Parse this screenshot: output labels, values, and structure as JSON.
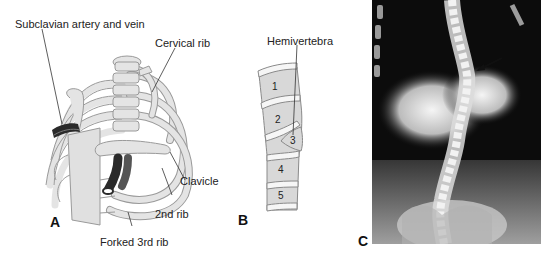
{
  "panels": {
    "a": {
      "letter": "A",
      "labels": {
        "subclavian": "Subclavian artery and vein",
        "cervical_rib": "Cervical rib",
        "clavicle": "Clavicle",
        "second_rib": "2nd rib",
        "forked_third_rib": "Forked 3rd rib"
      }
    },
    "b": {
      "letter": "B",
      "labels": {
        "hemivertebra": "Hemivertebra"
      },
      "vertebrae": [
        "1",
        "2",
        "3",
        "4",
        "5"
      ]
    },
    "c": {
      "letter": "C"
    }
  },
  "colors": {
    "bone": "#e4e4e4",
    "bone_outline": "#9a9a9a",
    "vessel": "#2a2a2a",
    "xray_dark": "#0c0c0c",
    "xray_light": "#f2f2f2"
  }
}
